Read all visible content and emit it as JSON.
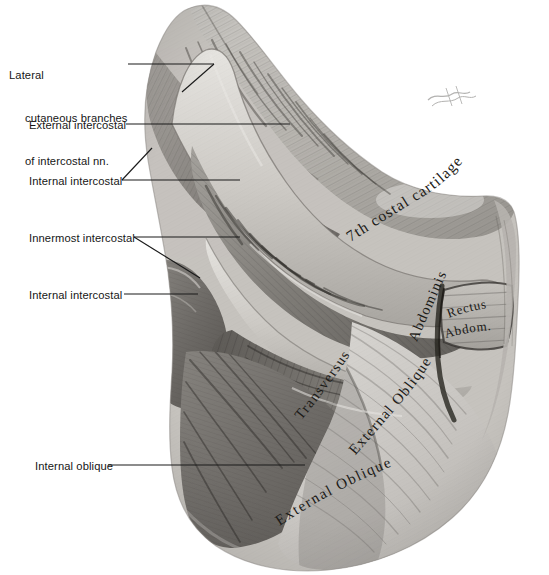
{
  "figure": {
    "type": "anatomical-illustration",
    "medium": "grayscale pencil/wash drawing",
    "background_color": "#ffffff",
    "ink_color": "#161616",
    "artist_signature": "illegible signature"
  },
  "leader_labels": [
    {
      "id": "lateral-cutaneous-branches",
      "line1": "Lateral",
      "line2": "cutaneous branches",
      "line3": "of intercostal nn.",
      "text": "Lateral cutaneous branches of intercostal nn."
    },
    {
      "id": "external-intercostal",
      "text": "External intercostal"
    },
    {
      "id": "internal-intercostal-upper",
      "text": "Internal intercostal"
    },
    {
      "id": "innermost-intercostal",
      "text": "Innermost intercostal"
    },
    {
      "id": "internal-intercostal-lower",
      "text": "Internal intercostal"
    },
    {
      "id": "internal-oblique",
      "text": "Internal oblique"
    }
  ],
  "inline_labels": [
    {
      "id": "seventh-costal-cartilage",
      "text": "7th costal cartilage"
    },
    {
      "id": "transversus",
      "text": "Transversus"
    },
    {
      "id": "abdominis",
      "text": "Abdominis"
    },
    {
      "id": "rectus",
      "text": "Rectus"
    },
    {
      "id": "rectus-abdom",
      "text": "Abdom."
    },
    {
      "id": "external-oblique-upper",
      "text": "External Oblique"
    },
    {
      "id": "external-oblique-lower",
      "text": "External Oblique"
    }
  ]
}
